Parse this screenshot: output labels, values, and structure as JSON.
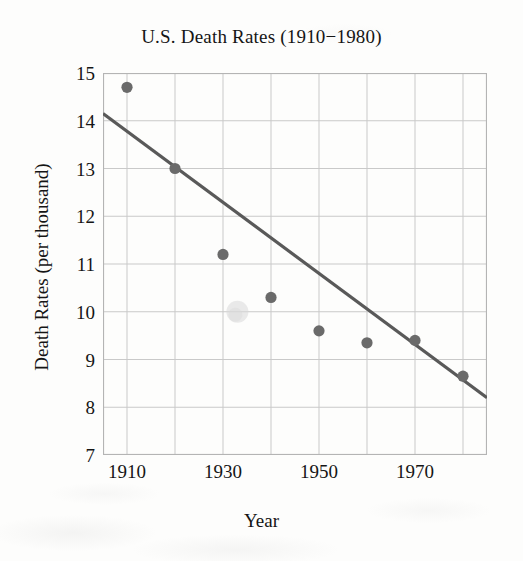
{
  "chart_data": {
    "type": "scatter",
    "title": "U.S. Death Rates (1910−1980)",
    "xlabel": "Year",
    "ylabel": "Death Rates (per thousand)",
    "xlim": [
      1905,
      1985
    ],
    "ylim": [
      7,
      15
    ],
    "grid": true,
    "legend": "none",
    "x": [
      1910,
      1920,
      1930,
      1940,
      1950,
      1960,
      1970,
      1980
    ],
    "y": [
      14.7,
      13.0,
      11.2,
      10.3,
      9.6,
      9.35,
      9.4,
      8.65
    ],
    "series": [
      {
        "name": "Death rate",
        "type": "scatter",
        "marker": "circle",
        "color": "#6a6a6a",
        "points": [
          {
            "year": 1910,
            "rate": 14.7
          },
          {
            "year": 1920,
            "rate": 13.0
          },
          {
            "year": 1930,
            "rate": 11.2
          },
          {
            "year": 1940,
            "rate": 10.3
          },
          {
            "year": 1950,
            "rate": 9.6
          },
          {
            "year": 1960,
            "rate": 9.35
          },
          {
            "year": 1970,
            "rate": 9.4
          },
          {
            "year": 1980,
            "rate": 8.65
          }
        ]
      },
      {
        "name": "Fitted regression line",
        "type": "line",
        "color": "#595959",
        "endpoints": [
          {
            "year": 1905,
            "rate": 14.15
          },
          {
            "year": 1985,
            "rate": 8.2
          }
        ]
      }
    ],
    "annotations": [
      {
        "name": "scan-smudge",
        "year": 1933,
        "rate": 10.0,
        "color": "#d9d9d9"
      }
    ],
    "x_ticks_major": [
      1910,
      1930,
      1950,
      1970
    ],
    "x_ticks_minor": [
      1920,
      1940,
      1960,
      1980
    ],
    "x_tick_labels": [
      "1910",
      "1930",
      "1950",
      "1970"
    ],
    "y_ticks": [
      7,
      8,
      9,
      10,
      11,
      12,
      13,
      14,
      15
    ],
    "y_tick_labels": [
      "7",
      "8",
      "9",
      "10",
      "11",
      "12",
      "13",
      "14",
      "15"
    ]
  },
  "colors": {
    "marker": "#6a6a6a",
    "line": "#595959",
    "grid": "#c9c9c9",
    "frame": "#b4b4b4",
    "text": "#151515",
    "background": "#fdfdfc"
  }
}
